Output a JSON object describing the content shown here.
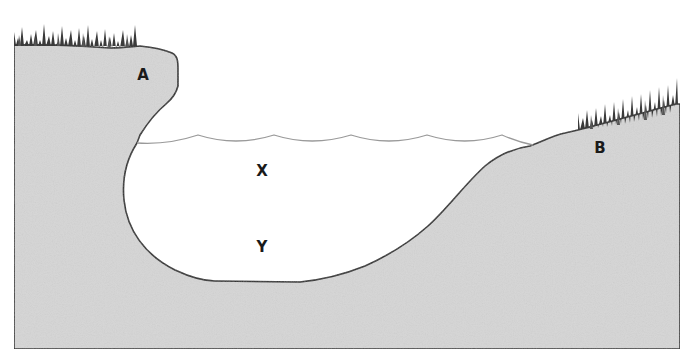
{
  "diagram": {
    "type": "lake cross-section",
    "labels": {
      "A": "A",
      "B": "B",
      "X": "X",
      "Y": "Y"
    },
    "label_positions": {
      "A": {
        "x": 143,
        "y": 80
      },
      "B": {
        "x": 600,
        "y": 153
      },
      "X": {
        "x": 262,
        "y": 176
      },
      "Y": {
        "x": 262,
        "y": 252
      }
    },
    "colors": {
      "ground": "#d6d6d6",
      "ground_dark": "#c8c8c8",
      "outline": "#2a2a2a",
      "water": "#ffffff",
      "water_line": "#9a9a9a",
      "grass": "#3a3a3a"
    },
    "elements": [
      {
        "id": "left-bank",
        "description": "Overhanging bank with grass on top, labeled A"
      },
      {
        "id": "right-bank",
        "description": "Gently sloping bank with grass on top, labeled B"
      },
      {
        "id": "water-surface",
        "description": "Scalloped water line"
      },
      {
        "id": "water-body",
        "description": "Lake water with points X (near surface) and Y (near bottom)"
      }
    ]
  }
}
